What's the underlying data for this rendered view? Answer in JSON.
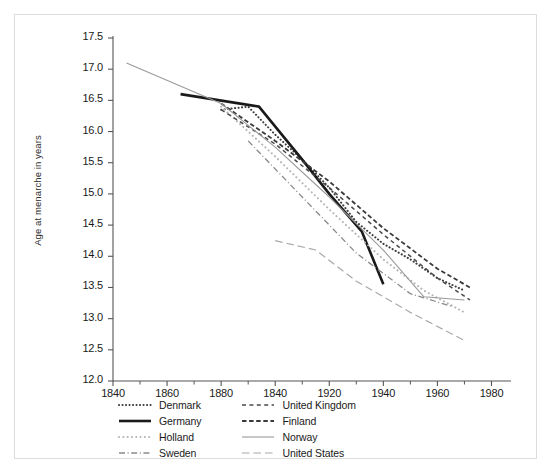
{
  "chart_data": {
    "type": "line",
    "title": "",
    "xlabel": "",
    "ylabel": "Age at menarche in years",
    "xlim": [
      1840,
      1985
    ],
    "ylim": [
      12.0,
      17.5
    ],
    "grid": false,
    "legend_position": "below-axes",
    "xticks": [
      1840,
      1860,
      1880,
      1840,
      1920,
      1940,
      1960,
      1980
    ],
    "xtick_positions": [
      1840,
      1860,
      1880,
      1900,
      1920,
      1940,
      1960,
      1980
    ],
    "yticks": [
      "12.0",
      "12.5",
      "13.0",
      "13.5",
      "14.0",
      "14.5",
      "15.0",
      "15.5",
      "16.0",
      "16.5",
      "17.0",
      "17.5"
    ],
    "series": [
      {
        "name": "Denmark",
        "style": "dotted",
        "color": "#3a3a3a",
        "width": 2.0,
        "x": [
          1880,
          1890,
          1900,
          1910,
          1920,
          1930,
          1940,
          1950,
          1960,
          1970
        ],
        "y": [
          16.35,
          16.4,
          15.95,
          15.55,
          15.1,
          14.55,
          14.2,
          13.95,
          13.65,
          13.45
        ]
      },
      {
        "name": "Germany",
        "style": "solid-thick",
        "color": "#1a1a1a",
        "width": 2.6,
        "x": [
          1865,
          1894,
          1910,
          1920,
          1932,
          1940
        ],
        "y": [
          16.6,
          16.4,
          15.55,
          15.0,
          14.4,
          13.55
        ]
      },
      {
        "name": "Holland",
        "style": "dotted-light",
        "color": "#b4b4b4",
        "width": 2.0,
        "x": [
          1880,
          1900,
          1920,
          1940,
          1955,
          1970
        ],
        "y": [
          16.4,
          15.6,
          14.75,
          13.95,
          13.45,
          13.1
        ]
      },
      {
        "name": "Sweden",
        "style": "dashdot",
        "color": "#8a8a8a",
        "width": 1.3,
        "x": [
          1890,
          1910,
          1930,
          1950,
          1965
        ],
        "y": [
          15.85,
          14.95,
          14.05,
          13.4,
          13.2
        ]
      },
      {
        "name": "United Kingdom",
        "style": "dashed",
        "color": "#4a4a4a",
        "width": 1.5,
        "x": [
          1880,
          1900,
          1920,
          1940,
          1960,
          1972
        ],
        "y": [
          16.35,
          15.8,
          15.1,
          14.35,
          13.65,
          13.3
        ]
      },
      {
        "name": "Finland",
        "style": "dashed-dense",
        "color": "#3a3a3a",
        "width": 1.8,
        "x": [
          1880,
          1900,
          1920,
          1940,
          1960,
          1972
        ],
        "y": [
          16.45,
          15.85,
          15.2,
          14.45,
          13.8,
          13.5
        ]
      },
      {
        "name": "Norway",
        "style": "solid-thin",
        "color": "#9a9a9a",
        "width": 1.1,
        "x": [
          1845,
          1880,
          1900,
          1920,
          1940,
          1955,
          1970
        ],
        "y": [
          17.1,
          16.45,
          15.75,
          14.95,
          14.1,
          13.35,
          13.3
        ]
      },
      {
        "name": "United States",
        "style": "longdash",
        "color": "#a8a8a8",
        "width": 1.2,
        "x": [
          1900,
          1915,
          1930,
          1950,
          1970
        ],
        "y": [
          14.25,
          14.1,
          13.6,
          13.1,
          12.65
        ]
      }
    ]
  },
  "legend": {
    "columns": [
      [
        {
          "label": "Denmark",
          "style": "dotted"
        },
        {
          "label": "Germany",
          "style": "solid-thick"
        },
        {
          "label": "Holland",
          "style": "dotted-light"
        },
        {
          "label": "Sweden",
          "style": "dashdot"
        }
      ],
      [
        {
          "label": "United Kingdom",
          "style": "dashed"
        },
        {
          "label": "Finland",
          "style": "dashed-dense"
        },
        {
          "label": "Norway",
          "style": "solid-thin"
        },
        {
          "label": "United States",
          "style": "longdash"
        }
      ]
    ]
  }
}
